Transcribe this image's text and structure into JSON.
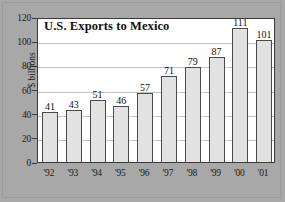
{
  "chart_data": {
    "type": "bar",
    "title": "U.S. Exports to Mexico",
    "xlabel": "",
    "ylabel": "$ billions",
    "categories": [
      "'92",
      "'93",
      "'94",
      "'95",
      "'96",
      "'97",
      "'98",
      "'99",
      "'00",
      "'01"
    ],
    "values": [
      41,
      43,
      51,
      46,
      57,
      71,
      79,
      87,
      111,
      101
    ],
    "data_labels": [
      "41",
      "43",
      "51",
      "46",
      "57",
      "71",
      "79",
      "87",
      "111",
      "101"
    ],
    "ylim": [
      0,
      120
    ],
    "yticks": [
      0,
      20,
      40,
      60,
      80,
      100,
      120
    ],
    "ytick_labels": [
      "0",
      "20",
      "40",
      "60",
      "80",
      "100",
      "120"
    ],
    "grid": true,
    "grid_axis": "y",
    "legend": false,
    "legend_position": "none",
    "colors": {
      "bar_fill": "#e2e2e2",
      "bar_stroke": "#4a4a4a",
      "plot_background": "#ffffff",
      "page_background": "#a8a8a8",
      "gridline": "#c4c4c4",
      "axis": "#3a3a3a",
      "text": "#111111"
    }
  }
}
